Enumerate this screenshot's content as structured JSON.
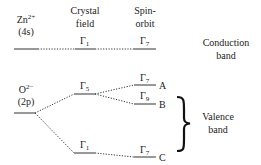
{
  "headers": {
    "zn": {
      "base": "Zn",
      "charge": "2+",
      "orbital": "(4s)"
    },
    "crystal_field": [
      "Crystal",
      "field"
    ],
    "spin_orbit": [
      "Spin-",
      "orbit"
    ]
  },
  "oxygen": {
    "base": "O",
    "charge": "2−",
    "orbital": "(2p)"
  },
  "conduction": {
    "label": [
      "Conduction",
      "band"
    ],
    "crystal_field_level": {
      "gamma": "Γ",
      "sub": "1"
    },
    "spin_orbit_level": {
      "gamma": "Γ",
      "sub": "7"
    }
  },
  "valence": {
    "label": [
      "Valence",
      "band"
    ],
    "crystal_field_levels": [
      {
        "gamma": "Γ",
        "sub": "5"
      },
      {
        "gamma": "Γ",
        "sub": "1"
      }
    ],
    "spin_orbit_levels": [
      {
        "gamma": "Γ",
        "sub": "7",
        "tag": "A"
      },
      {
        "gamma": "Γ",
        "sub": "9",
        "tag": "B"
      },
      {
        "gamma": "Γ",
        "sub": "7",
        "tag": "C"
      }
    ]
  }
}
